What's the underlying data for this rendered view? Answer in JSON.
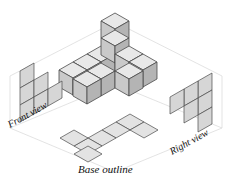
{
  "figure": {
    "kind": "isometric-cube-stack-with-orthographic-projections",
    "captions": {
      "front_view": "Front view",
      "right_view": "Right view",
      "base_outline": "Base outline"
    },
    "colors": {
      "background": "#ffffff",
      "face_top": "#e8e8e8",
      "face_left": "#c9c9c9",
      "face_right": "#b4b4b4",
      "projection_fill": "#d6d6d6",
      "projection_fill_light": "#e3e3e3",
      "edge_stroke": "#4a4a4a",
      "guide_stroke": "#d9d9d9",
      "text": "#111111"
    },
    "geometry": {
      "iso_half_width": 14,
      "iso_half_height": 8,
      "cube_height": 17,
      "origin_x": 115,
      "origin_y": 86
    },
    "cube_stack": {
      "description": "Stack of unit cubes on a 3x3 base footprint, heights per column",
      "columns": [
        {
          "col": 0,
          "row": 0,
          "height": 1
        },
        {
          "col": 0,
          "row": 1,
          "height": 1
        },
        {
          "col": 0,
          "row": 2,
          "height": 2
        },
        {
          "col": 1,
          "row": 2,
          "height": 3
        },
        {
          "col": 2,
          "row": 2,
          "height": 2
        },
        {
          "col": 2,
          "row": 1,
          "height": 1
        },
        {
          "col": 2,
          "row": 0,
          "height": 1
        }
      ],
      "total_cubes": 11
    },
    "front_view": {
      "type": "orthographic-projection",
      "grid_cols": 3,
      "grid_rows": 3,
      "filled_cells": [
        {
          "col": 0,
          "row": 0
        },
        {
          "col": 0,
          "row": 1
        },
        {
          "col": 1,
          "row": 1
        },
        {
          "col": 0,
          "row": 2
        },
        {
          "col": 1,
          "row": 2
        },
        {
          "col": 2,
          "row": 2
        }
      ],
      "cell_count": 6
    },
    "right_view": {
      "type": "orthographic-projection",
      "grid_cols": 3,
      "grid_rows": 3,
      "filled_cells": [
        {
          "col": 2,
          "row": 0
        },
        {
          "col": 1,
          "row": 1
        },
        {
          "col": 2,
          "row": 1
        },
        {
          "col": 0,
          "row": 2
        },
        {
          "col": 1,
          "row": 2
        },
        {
          "col": 2,
          "row": 2
        }
      ],
      "cell_count": 6
    },
    "base_outline": {
      "type": "plan-projection",
      "grid_cols": 3,
      "grid_rows": 3,
      "filled_cells": [
        {
          "col": 0,
          "row": 2
        },
        {
          "col": 0,
          "row": 1
        },
        {
          "col": 1,
          "row": 1
        },
        {
          "col": 2,
          "row": 1
        },
        {
          "col": 2,
          "row": 0
        }
      ],
      "cell_count": 7
    }
  }
}
